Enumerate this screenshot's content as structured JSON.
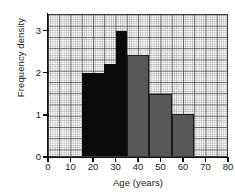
{
  "chart_data": {
    "type": "bar",
    "title": "",
    "xlabel": "Age (years)",
    "ylabel": "Frequency density",
    "xlim": [
      0,
      80
    ],
    "ylim": [
      0,
      3.4
    ],
    "xticks": [
      0,
      10,
      20,
      30,
      40,
      50,
      60,
      70,
      80
    ],
    "yticks": [
      0,
      1,
      2,
      3
    ],
    "grid": true,
    "grid_style": "graph-paper",
    "legend": "none",
    "bins": [
      {
        "label": "15-25",
        "x0": 15,
        "x1": 25,
        "value": 2.0,
        "color": "#0b0b0b",
        "shade": "black"
      },
      {
        "label": "25-30",
        "x0": 25,
        "x1": 30,
        "value": 2.2,
        "color": "#0b0b0b",
        "shade": "black"
      },
      {
        "label": "30-35",
        "x0": 30,
        "x1": 35,
        "value": 3.0,
        "color": "#0b0b0b",
        "shade": "black"
      },
      {
        "label": "35-45",
        "x0": 35,
        "x1": 45,
        "value": 2.43,
        "color": "#575757",
        "shade": "grey"
      },
      {
        "label": "45-55",
        "x0": 45,
        "x1": 55,
        "value": 1.51,
        "color": "#575757",
        "shade": "grey"
      },
      {
        "label": "55-65",
        "x0": 55,
        "x1": 65,
        "value": 1.02,
        "color": "#575757",
        "shade": "grey"
      }
    ]
  },
  "axes": {
    "x_tick_labels": [
      "0",
      "10",
      "20",
      "30",
      "40",
      "50",
      "60",
      "70",
      "80"
    ],
    "y_tick_labels": [
      "0",
      "1",
      "2",
      "3"
    ],
    "x_title": "Age (years)",
    "y_title": "Frequency density"
  },
  "colors": {
    "bar_black": "#0b0b0b",
    "bar_grey": "#575757",
    "grid_major": "#464646",
    "grid_minor": "#787878",
    "axis": "#111111",
    "background": "#ffffff"
  }
}
